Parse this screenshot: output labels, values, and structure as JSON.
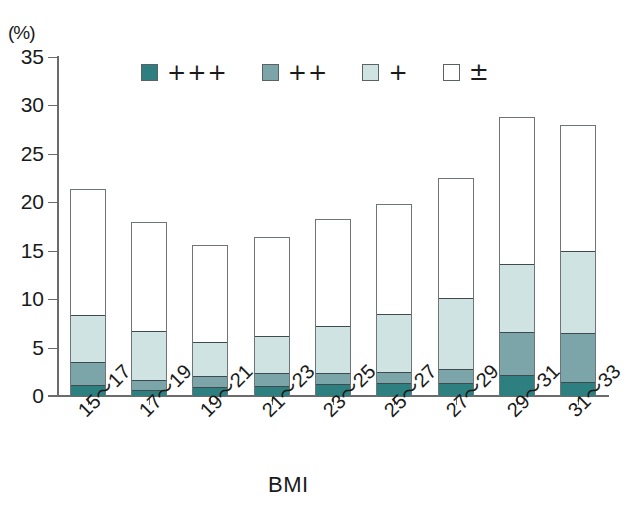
{
  "chart_data": {
    "type": "bar",
    "subtype": "stacked-vertical",
    "title": "",
    "subtitle": "",
    "xlabel": "BMI",
    "ylabel": "(%)",
    "y_unit_label": "(%)",
    "categories": [
      "15～17",
      "17～19",
      "19～21",
      "21～23",
      "23～25",
      "25～27",
      "27～29",
      "29～31",
      "31～33"
    ],
    "ylim": [
      0,
      35
    ],
    "yticks": [
      0,
      5,
      10,
      15,
      20,
      25,
      30,
      35
    ],
    "ytick_labels": [
      "0",
      "5",
      "10",
      "15",
      "20",
      "25",
      "30",
      "35"
    ],
    "grid": false,
    "legend_position": "top-inside",
    "stack_order_bottom_to_top": [
      "+++",
      "++",
      "+",
      "±"
    ],
    "series": [
      {
        "name": "+++",
        "color": "#2e7f80",
        "values": [
          1.1,
          0.6,
          0.9,
          1.0,
          1.2,
          1.3,
          1.3,
          2.2,
          1.5
        ]
      },
      {
        "name": "++",
        "color": "#7ba5a8",
        "values": [
          2.4,
          1.1,
          1.2,
          1.4,
          1.2,
          1.2,
          1.5,
          4.4,
          5.0
        ]
      },
      {
        "name": "+",
        "color": "#cfe3e3",
        "values": [
          4.9,
          5.0,
          3.5,
          3.8,
          4.9,
          6.0,
          7.4,
          7.1,
          8.5
        ]
      },
      {
        "name": "±",
        "color": "#ffffff",
        "values": [
          13.0,
          11.3,
          10.0,
          10.2,
          11.0,
          11.3,
          12.3,
          15.1,
          13.0
        ]
      }
    ],
    "totals": [
      21.4,
      18.0,
      15.6,
      16.4,
      18.3,
      19.8,
      22.5,
      28.8,
      28.0
    ],
    "cumulative_tops": {
      "+++": [
        1.1,
        0.6,
        0.9,
        1.0,
        1.2,
        1.3,
        1.3,
        2.2,
        1.5
      ],
      "++": [
        3.5,
        1.7,
        2.1,
        2.4,
        2.4,
        2.5,
        2.8,
        6.6,
        6.5
      ],
      "+": [
        8.4,
        6.7,
        5.6,
        6.2,
        7.3,
        8.5,
        10.2,
        13.7,
        15.0
      ],
      "±": [
        21.4,
        18.0,
        15.6,
        16.4,
        18.3,
        19.8,
        22.5,
        28.8,
        28.0
      ]
    }
  },
  "legend": {
    "items": [
      {
        "label": "+++",
        "color": "#2e7f80"
      },
      {
        "label": "++",
        "color": "#7ba5a8"
      },
      {
        "label": "+",
        "color": "#cfe3e3"
      },
      {
        "label": "±",
        "color": "#ffffff"
      }
    ]
  },
  "colors": {
    "plus3": "#2e7f80",
    "plus2": "#7ba5a8",
    "plus1": "#cfe3e3",
    "pm": "#ffffff",
    "axis": "#6b6b6b",
    "bar_outline": "#6f7478",
    "text": "#1a1a1a"
  }
}
